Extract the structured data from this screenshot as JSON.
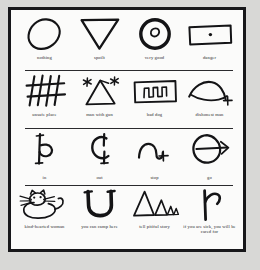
{
  "document": {
    "title": "Hobo Sign Pictograph Chart",
    "background_color": "#d8d8d6",
    "page_color": "#fbfbfa",
    "ink_color": "#141416",
    "border_color": "#17171a"
  },
  "rows": [
    {
      "row_number": 1,
      "cells": [
        {
          "glyph": "oval-sign",
          "label": "nothing"
        },
        {
          "glyph": "downward-triangle-sign",
          "label": "spoilt"
        },
        {
          "glyph": "circle-with-inner-dot-sign",
          "label": "very good"
        },
        {
          "glyph": "rectangle-with-center-dot-sign",
          "label": "danger"
        }
      ]
    },
    {
      "row_number": 2,
      "cells": [
        {
          "glyph": "crosshatch-grid-sign",
          "label": "unsafe place"
        },
        {
          "glyph": "triangle-with-stars-sign",
          "label": "man with gun"
        },
        {
          "glyph": "box-with-teeth-sign",
          "label": "bad dog"
        },
        {
          "glyph": "arc-with-cross-sign",
          "label": "dishonest man"
        }
      ]
    },
    {
      "row_number": 3,
      "cells": [
        {
          "glyph": "right-hook-sign",
          "label": "in"
        },
        {
          "glyph": "left-hook-sign",
          "label": "out"
        },
        {
          "glyph": "arch-with-cross-sign",
          "label": "stop"
        },
        {
          "glyph": "circle-with-arrow-sign",
          "label": "go"
        }
      ]
    },
    {
      "row_number": 4,
      "cells": [
        {
          "glyph": "cat-sign",
          "label": "kind-hearted woman"
        },
        {
          "glyph": "u-shape-sign",
          "label": "you can camp here"
        },
        {
          "glyph": "descending-triangles-sign",
          "label": "tell pitiful story"
        },
        {
          "glyph": "branch-hook-sign",
          "label": "if you are sick, you will be cared for"
        }
      ]
    }
  ]
}
